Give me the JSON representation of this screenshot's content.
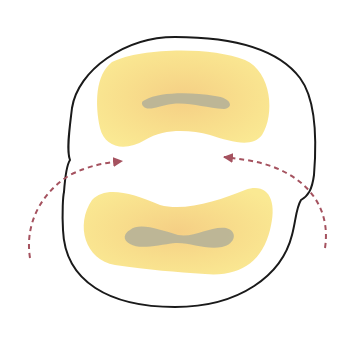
{
  "diagram": {
    "colors": {
      "background": "#ffffff",
      "outline": "#1a1a1a",
      "blob_fill": "#f8e38f",
      "blob_center": "#f5cf85",
      "core_fill": "#b9b497",
      "arrow": "#a5525f"
    },
    "elements": {
      "outline": {
        "label": ""
      },
      "upper_region": {
        "label": ""
      },
      "upper_core": {
        "label": ""
      },
      "lower_region": {
        "label": ""
      },
      "lower_core": {
        "label": ""
      },
      "left_arrow": {
        "direction": "right",
        "style": "dashed"
      },
      "right_arrow": {
        "direction": "left",
        "style": "dashed"
      }
    }
  }
}
